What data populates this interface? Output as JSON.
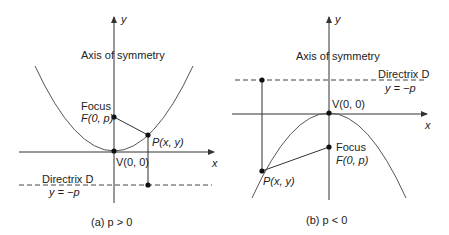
{
  "panels": [
    {
      "id": "a",
      "caption": "(a)  p > 0",
      "y_axis_label": "y",
      "x_axis_label": "x",
      "axis_of_symmetry_label": "Axis of symmetry",
      "focus_label": "Focus",
      "focus_point_label": "F(0, p)",
      "point_label": "P(x, y)",
      "vertex_label": "V(0, 0)",
      "directrix_label": "Directrix D",
      "directrix_equation": "y = −p",
      "opens": "up"
    },
    {
      "id": "b",
      "caption": "(b)  p < 0",
      "y_axis_label": "y",
      "x_axis_label": "x",
      "axis_of_symmetry_label": "Axis of symmetry",
      "focus_label": "Focus",
      "focus_point_label": "F(0, p)",
      "point_label": "P(x, y)",
      "vertex_label": "V(0, 0)",
      "directrix_label": "Directrix D",
      "directrix_equation": "y = −p",
      "opens": "down"
    }
  ],
  "colors": {
    "line": "#333333",
    "curve": "#555555",
    "text": "#222222"
  }
}
